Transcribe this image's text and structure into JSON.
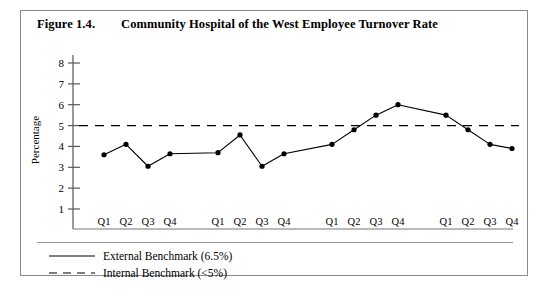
{
  "figure": {
    "label": "Figure 1.4.",
    "title": "Community Hospital of the West Employee Turnover Rate"
  },
  "legend": {
    "external": {
      "label": "External Benchmark (6.5%)",
      "style": "solid",
      "color": "#000000"
    },
    "internal": {
      "label": "Internal Benchmark (<5%)",
      "style": "dashed",
      "color": "#000000"
    }
  },
  "chart_data": {
    "type": "line",
    "title": "Community Hospital of the West Employee Turnover Rate",
    "xlabel": "",
    "ylabel": "Percentage",
    "ylim": [
      0,
      8
    ],
    "yticks": [
      1,
      2,
      3,
      4,
      5,
      6,
      7,
      8
    ],
    "grid": false,
    "legend_position": "below-plot",
    "groups": [
      "Year 1",
      "Year 2",
      "Year 3",
      "Year 4"
    ],
    "quarters": [
      "Q1",
      "Q2",
      "Q3",
      "Q4"
    ],
    "categories": [
      "Year 1 Q1",
      "Year 1 Q2",
      "Year 1 Q3",
      "Year 1 Q4",
      "Year 2 Q1",
      "Year 2 Q2",
      "Year 2 Q3",
      "Year 2 Q4",
      "Year 3 Q1",
      "Year 3 Q2",
      "Year 3 Q3",
      "Year 3 Q4",
      "Year 4 Q1",
      "Year 4 Q2",
      "Year 4 Q3",
      "Year 4 Q4"
    ],
    "series": [
      {
        "name": "Employee Turnover Rate",
        "marker": "filled-circle",
        "color": "#000000",
        "values": [
          3.6,
          4.1,
          3.05,
          3.65,
          3.7,
          4.55,
          3.05,
          3.65,
          4.1,
          4.8,
          5.5,
          6.0,
          5.5,
          4.8,
          4.1,
          3.9
        ]
      }
    ],
    "reference_lines": [
      {
        "name": "Internal Benchmark (<5%)",
        "value": 5,
        "style": "dashed",
        "color": "#000000"
      }
    ],
    "annotations": []
  }
}
